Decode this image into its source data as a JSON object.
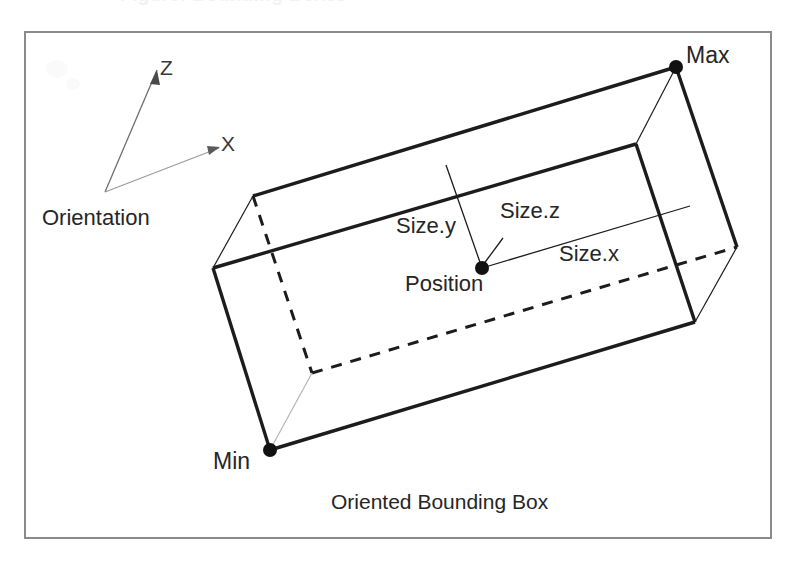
{
  "page": {
    "clipped_heading": "Figure: Bounding Boxes",
    "background_color": "#ffffff",
    "ink_color": "#1c1c1c"
  },
  "frame": {
    "name": "figure-border",
    "x": 25,
    "y": 32,
    "width": 746,
    "height": 506,
    "stroke_color": "#8a8a8a"
  },
  "caption": {
    "text": "Oriented Bounding Box"
  },
  "orientation_gizmo": {
    "label": "Orientation",
    "origin": {
      "x": 105,
      "y": 192
    },
    "axes": [
      {
        "name": "z-axis",
        "label": "Z",
        "tip_x": 157,
        "tip_y": 70,
        "color": "#6e6e6e"
      },
      {
        "name": "x-axis",
        "label": "X",
        "tip_x": 219,
        "tip_y": 148,
        "color": "#9a9a9a"
      }
    ]
  },
  "box": {
    "name": "oriented-bounding-box",
    "vertices": {
      "max": {
        "x": 676,
        "y": 67,
        "label": "Max"
      },
      "back_top_left": {
        "x": 253,
        "y": 196
      },
      "front_top_left": {
        "x": 213,
        "y": 268
      },
      "front_top_right": {
        "x": 636,
        "y": 144
      },
      "back_bottom_right": {
        "x": 737,
        "y": 247
      },
      "front_bottom_right": {
        "x": 695,
        "y": 322
      },
      "min": {
        "x": 270,
        "y": 450,
        "label": "Min"
      },
      "hidden_back_bottom_left": {
        "x": 312,
        "y": 373
      }
    },
    "edge_styles": {
      "visible": "solid",
      "hidden": "dashed"
    },
    "corner_dot_radius": 7
  },
  "annotations": {
    "position": {
      "label": "Position",
      "point": {
        "x": 482,
        "y": 268
      }
    },
    "size_y": {
      "label": "Size.y",
      "leader_from": {
        "x": 446,
        "y": 165
      },
      "leader_to": {
        "x": 482,
        "y": 268
      }
    },
    "size_z": {
      "label": "Size.z",
      "leader_from": {
        "x": 503,
        "y": 238
      },
      "leader_to": {
        "x": 483,
        "y": 265
      }
    },
    "size_x": {
      "label": "Size.x",
      "leader_from": {
        "x": 482,
        "y": 268
      },
      "leader_to": {
        "x": 690,
        "y": 206
      }
    }
  }
}
